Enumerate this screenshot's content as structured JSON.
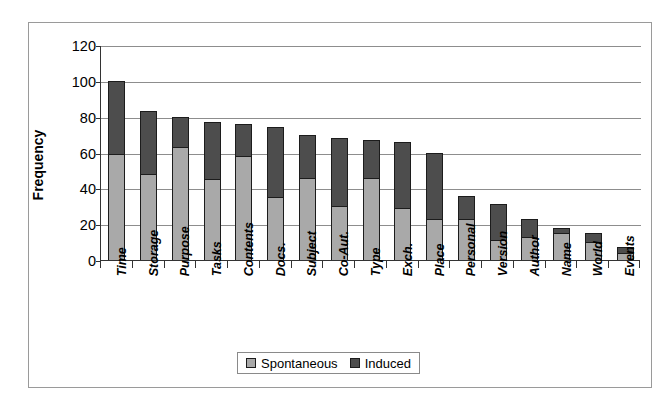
{
  "chart_data": {
    "type": "bar",
    "subtype": "stacked-vertical",
    "title": "",
    "xlabel": "",
    "ylabel": "Frequency",
    "ylim": [
      0,
      120
    ],
    "ytick_step": 20,
    "yticks": [
      0,
      20,
      40,
      60,
      80,
      100,
      120
    ],
    "grid": true,
    "legend_position": "bottom-center",
    "categories": [
      "Time",
      "Storage",
      "Purpose",
      "Tasks",
      "Contents",
      "Docs.",
      "Subject",
      "Co-Aut.",
      "Type",
      "Exch.",
      "Place",
      "Personal",
      "Version",
      "Author",
      "Name",
      "World",
      "Events"
    ],
    "series": [
      {
        "name": "Spontaneous",
        "color": "#a9a9a9",
        "values": [
          59,
          48,
          63,
          45,
          58,
          35,
          46,
          30,
          46,
          29,
          23,
          23,
          11,
          13,
          15,
          10,
          4
        ]
      },
      {
        "name": "Induced",
        "color": "#4d4d4d",
        "values": [
          41,
          35,
          17,
          32,
          18,
          39,
          24,
          38,
          21,
          37,
          37,
          13,
          20,
          10,
          3,
          5,
          3
        ]
      }
    ],
    "totals": [
      100,
      83,
      80,
      77,
      76,
      74,
      70,
      68,
      67,
      66,
      60,
      36,
      31,
      23,
      18,
      15,
      7
    ]
  },
  "legend": {
    "entries": [
      {
        "label": "Spontaneous",
        "color": "#a9a9a9"
      },
      {
        "label": "Induced",
        "color": "#4d4d4d"
      }
    ]
  },
  "axis": {
    "y_title": "Frequency",
    "y_tick_labels": [
      "120",
      "100",
      "80",
      "60",
      "40",
      "20",
      "0"
    ]
  }
}
